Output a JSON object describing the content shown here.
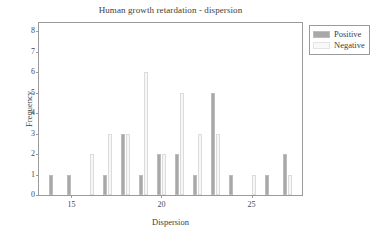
{
  "chart_data": {
    "type": "bar",
    "title": "Human growth retardation - dispersion",
    "xlabel": "Dispersion",
    "ylabel": "Frequency",
    "xlim": [
      13.2,
      27.8
    ],
    "ylim": [
      0,
      8.4
    ],
    "grid": false,
    "legend_position": "outside-top-right",
    "x_ticks": [
      15,
      20,
      25
    ],
    "y_ticks": [
      0,
      1,
      2,
      3,
      4,
      5,
      6,
      7,
      8
    ],
    "categories": [
      14,
      15,
      16,
      17,
      18,
      19,
      20,
      21,
      22,
      23,
      24,
      25,
      26,
      27
    ],
    "series": [
      {
        "name": "Positive",
        "color": "#a8a8a8",
        "values": [
          1,
          1,
          0,
          1,
          3,
          1,
          2,
          2,
          1,
          5,
          1,
          0,
          1,
          2
        ]
      },
      {
        "name": "Negative",
        "color": "#f7f7f7",
        "values": [
          0,
          0,
          2,
          3,
          3,
          6,
          2,
          5,
          3,
          3,
          0,
          1,
          0,
          1
        ]
      }
    ]
  },
  "legend": {
    "items": [
      {
        "label": "Positive",
        "swatch": "positive-swatch"
      },
      {
        "label": "Negative",
        "swatch": "negative-swatch"
      }
    ]
  }
}
